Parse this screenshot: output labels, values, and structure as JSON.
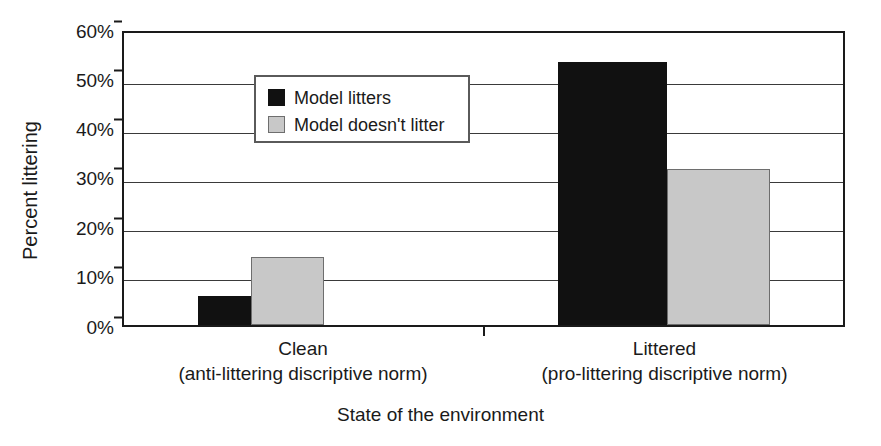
{
  "chart_data": {
    "type": "bar",
    "title": "",
    "xlabel": "State of the environment",
    "ylabel": "Percent littering",
    "categories": [
      "Clean",
      "Littered"
    ],
    "category_sublabels": [
      "(anti-littering discriptive norm)",
      "(pro-littering discriptive norm)"
    ],
    "series": [
      {
        "name": "Model litters",
        "values": [
          6,
          54
        ],
        "color": "#111111"
      },
      {
        "name": "Model doesn't litter",
        "values": [
          14,
          32
        ],
        "color": "#c8c8c8"
      }
    ],
    "ylim": [
      0,
      60
    ],
    "ytick_values": [
      0,
      10,
      20,
      30,
      40,
      50,
      60
    ],
    "ytick_labels": [
      "0%",
      "10%",
      "20%",
      "30%",
      "40%",
      "50%",
      "60%"
    ],
    "grid": true,
    "legend_position": "upper left inside plot",
    "value_format": "percent"
  },
  "axes": {
    "y": {
      "label": "Percent littering",
      "ticks": [
        {
          "label": "60%"
        },
        {
          "label": "50%"
        },
        {
          "label": "40%"
        },
        {
          "label": "30%"
        },
        {
          "label": "20%"
        },
        {
          "label": "10%"
        },
        {
          "label": "0%"
        }
      ]
    },
    "x": {
      "label": "State of the environment",
      "categories": [
        {
          "main": "Clean",
          "sub": "(anti-littering discriptive norm)"
        },
        {
          "main": "Littered",
          "sub": "(pro-littering discriptive norm)"
        }
      ]
    }
  },
  "legend": {
    "items": [
      {
        "label": "Model litters",
        "swatch": "black-square-swatch"
      },
      {
        "label": "Model doesn't litter",
        "swatch": "gray-square-swatch"
      }
    ]
  },
  "bars": [
    {
      "name": "bar-clean-model-litters",
      "value": "6%"
    },
    {
      "name": "bar-clean-model-doesnt-litter",
      "value": "14%"
    },
    {
      "name": "bar-littered-model-litters",
      "value": "54%"
    },
    {
      "name": "bar-littered-model-doesnt-litter",
      "value": "32%"
    }
  ]
}
